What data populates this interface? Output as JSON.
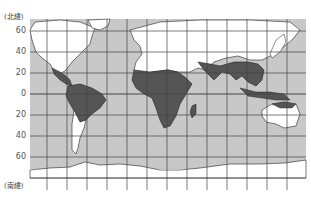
{
  "map": {
    "title": "Tropical regions world map",
    "north_label": "(北緯)",
    "south_label": "(南緯)",
    "lat_labels": [
      {
        "text": "60",
        "y": 31
      },
      {
        "text": "40",
        "y": 52
      },
      {
        "text": "20",
        "y": 73
      },
      {
        "text": "0",
        "y": 94
      },
      {
        "text": "20",
        "y": 115
      },
      {
        "text": "40",
        "y": 136
      },
      {
        "text": "60",
        "y": 157
      }
    ],
    "colors": {
      "ocean": "#c8c8c8",
      "land": "#ffffff",
      "highlight_region": "#555555",
      "grid": "#444444",
      "coast": "#222222"
    },
    "legend": {
      "highlight_region_meaning": "dark shaded land areas"
    }
  }
}
